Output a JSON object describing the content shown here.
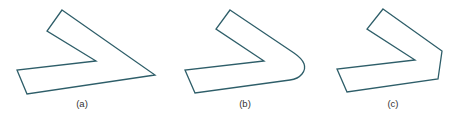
{
  "figure": {
    "stroke_color": "#2e5e69",
    "background": "#ffffff",
    "panels": [
      {
        "id": "a",
        "label": "(a)",
        "description": "Chevron outline with sharp (miter) outer corner",
        "path": "M62,10 L155,75 L27,94 L17,70 L96,61 L47,31 Z",
        "label_x": 82,
        "label_y": 107
      },
      {
        "id": "b",
        "label": "(b)",
        "description": "Chevron outline with rounded outer corner",
        "path": "M230,10 L294,53 Q310,64 302,74 Q298,79 290,80 L195,93 L185,70 L264,61 L216,29 Z",
        "label_x": 245,
        "label_y": 107
      },
      {
        "id": "c",
        "label": "(c)",
        "description": "Chevron outline with beveled outer corner",
        "path": "M383,9 L442,51 L438,79 L347,92 L337,69 L415,60 L367,29 Z",
        "label_x": 393,
        "label_y": 107
      }
    ]
  }
}
